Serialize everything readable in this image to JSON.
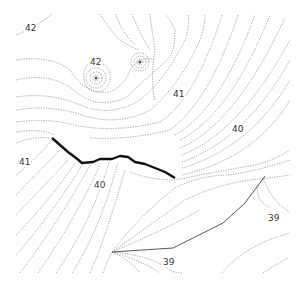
{
  "figure": {
    "type": "contour-map",
    "labels": [
      {
        "text": "42",
        "x": 24,
        "y": 23
      },
      {
        "text": "42",
        "x": 89,
        "y": 57
      },
      {
        "text": "41",
        "x": 172,
        "y": 89
      },
      {
        "text": "40",
        "x": 231,
        "y": 124
      },
      {
        "text": "41",
        "x": 18,
        "y": 157
      },
      {
        "text": "40",
        "x": 93,
        "y": 180
      },
      {
        "text": "39",
        "x": 267,
        "y": 213
      },
      {
        "text": "39",
        "x": 162,
        "y": 257
      }
    ],
    "point_sources": [
      {
        "name": "point-source-1",
        "x": 96,
        "y": 78
      },
      {
        "name": "point-source-2",
        "x": 140,
        "y": 62
      }
    ],
    "colors": {
      "contour": "#7a7a7a",
      "fault": "#111111",
      "boundary": "#444444",
      "background": "#ffffff"
    }
  }
}
